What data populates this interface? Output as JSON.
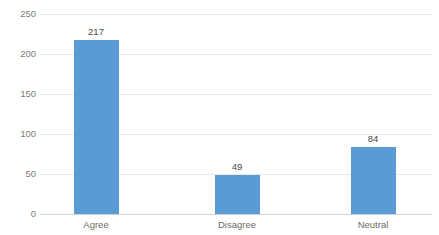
{
  "chart_data": {
    "type": "bar",
    "title": "",
    "title_note": "chart title is cropped off the top edge and illegible",
    "categories": [
      "Agree",
      "Disagree",
      "Neutral"
    ],
    "values": [
      217,
      49,
      84
    ],
    "xlabel": "",
    "ylabel": "",
    "ylim": [
      0,
      250
    ],
    "yticks": [
      0,
      50,
      100,
      150,
      200,
      250
    ],
    "ytick_labels": [
      "0",
      "50",
      "100",
      "150",
      "200",
      "250"
    ],
    "data_labels": [
      "217",
      "49",
      "84"
    ],
    "grid": true,
    "legend": false,
    "series": [
      {
        "name": "",
        "values": [
          217,
          49,
          84
        ],
        "color": "#5B9BD5"
      }
    ],
    "colors": {
      "bar": "#5B9BD5",
      "gridline": "#E8E8EA",
      "axis": "#D4D4D6",
      "tick_text": "#7A7A7A",
      "label_text": "#4A4A4A",
      "background": "#FFFFFF"
    }
  }
}
